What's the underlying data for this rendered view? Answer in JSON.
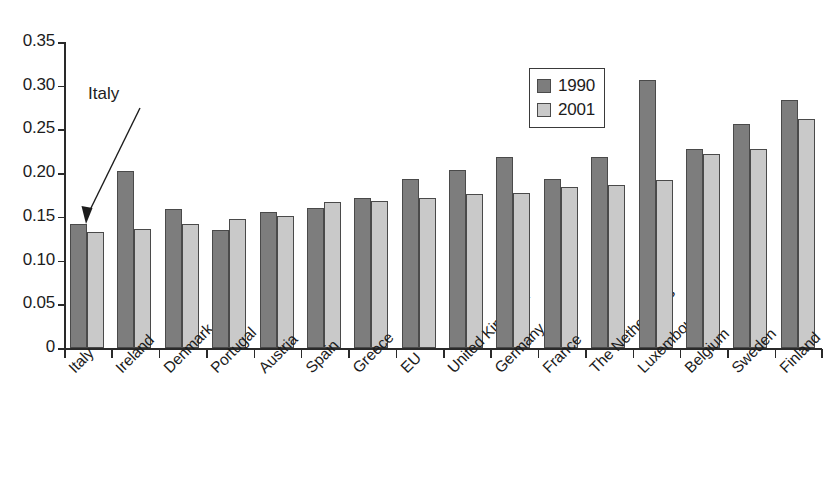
{
  "chart_data": {
    "type": "bar",
    "title": "",
    "subtitle": "",
    "xlabel": "",
    "ylabel": "",
    "ylim": [
      0,
      0.35
    ],
    "ytick_labels": [
      "0.35",
      "0.30",
      "0.25",
      "0.20",
      "0.15",
      "0.10",
      "0.05",
      "0"
    ],
    "ytick_values": [
      0.35,
      0.3,
      0.25,
      0.2,
      0.15,
      0.1,
      0.05,
      0
    ],
    "grid": false,
    "legend_position": "top-right",
    "categories": [
      "Italy",
      "Ireland",
      "Denmark",
      "Portugal",
      "Austria",
      "Spain",
      "Greece",
      "EU",
      "United Kingdom",
      "Germany",
      "France",
      "The Netherlands",
      "Luxembourg",
      "Belgium",
      "Sweden",
      "Finland"
    ],
    "series": [
      {
        "name": "1990",
        "color": "#7d7d7d",
        "values": [
          0.142,
          0.202,
          0.159,
          0.135,
          0.156,
          0.16,
          0.171,
          0.193,
          0.204,
          0.219,
          0.193,
          0.218,
          0.307,
          0.228,
          0.256,
          0.284
        ]
      },
      {
        "name": "2001",
        "color": "#c9c9c9",
        "values": [
          0.133,
          0.136,
          0.142,
          0.147,
          0.151,
          0.167,
          0.168,
          0.171,
          0.176,
          0.177,
          0.184,
          0.187,
          0.192,
          0.222,
          0.228,
          0.262
        ]
      }
    ],
    "annotations": [
      {
        "text": "Italy",
        "points_to_category": "Italy",
        "points_to_series": "1990"
      }
    ]
  },
  "legend": {
    "entries": [
      {
        "label": "1990"
      },
      {
        "label": "2001"
      }
    ]
  },
  "annotation": {
    "label": "Italy"
  }
}
